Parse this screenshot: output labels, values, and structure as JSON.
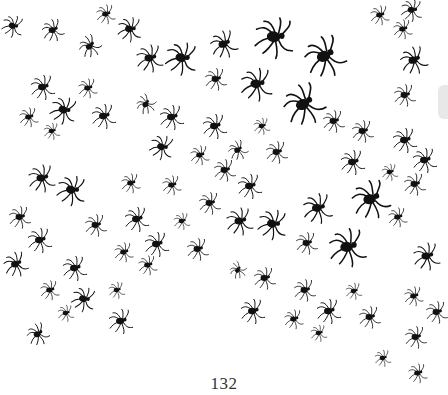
{
  "page": {
    "page_number": "132",
    "background_color": "#ffffff",
    "ink_color": "#111111",
    "illustration": "spider-swarm"
  },
  "spiders": [
    {
      "x": 13,
      "y": 26,
      "s": 0.8,
      "r": 20
    },
    {
      "x": 53,
      "y": 30,
      "s": 0.8,
      "r": -10
    },
    {
      "x": 106,
      "y": 14,
      "s": 0.7,
      "r": 0
    },
    {
      "x": 130,
      "y": 29,
      "s": 0.9,
      "r": 10
    },
    {
      "x": 90,
      "y": 46,
      "s": 0.8,
      "r": -30
    },
    {
      "x": 150,
      "y": 58,
      "s": 1.0,
      "r": 0
    },
    {
      "x": 182,
      "y": 58,
      "s": 1.2,
      "r": 15
    },
    {
      "x": 224,
      "y": 44,
      "s": 1.0,
      "r": -10
    },
    {
      "x": 275,
      "y": 37,
      "s": 1.5,
      "r": 10
    },
    {
      "x": 325,
      "y": 56,
      "s": 1.5,
      "r": -15
    },
    {
      "x": 257,
      "y": 84,
      "s": 1.2,
      "r": 5
    },
    {
      "x": 216,
      "y": 79,
      "s": 0.8,
      "r": 0
    },
    {
      "x": 304,
      "y": 104,
      "s": 1.5,
      "r": -20
    },
    {
      "x": 380,
      "y": 15,
      "s": 0.7,
      "r": 0
    },
    {
      "x": 412,
      "y": 10,
      "s": 0.8,
      "r": 10
    },
    {
      "x": 403,
      "y": 29,
      "s": 0.7,
      "r": 0
    },
    {
      "x": 414,
      "y": 60,
      "s": 1.0,
      "r": -10
    },
    {
      "x": 405,
      "y": 95,
      "s": 0.8,
      "r": 0
    },
    {
      "x": 43,
      "y": 87,
      "s": 0.9,
      "r": 0
    },
    {
      "x": 88,
      "y": 88,
      "s": 0.7,
      "r": 0
    },
    {
      "x": 64,
      "y": 110,
      "s": 1.0,
      "r": 20
    },
    {
      "x": 29,
      "y": 117,
      "s": 0.7,
      "r": 0
    },
    {
      "x": 104,
      "y": 116,
      "s": 0.9,
      "r": 0
    },
    {
      "x": 52,
      "y": 131,
      "s": 0.6,
      "r": 0
    },
    {
      "x": 146,
      "y": 104,
      "s": 0.7,
      "r": -40
    },
    {
      "x": 172,
      "y": 117,
      "s": 0.9,
      "r": 0
    },
    {
      "x": 162,
      "y": 147,
      "s": 0.9,
      "r": 20
    },
    {
      "x": 200,
      "y": 155,
      "s": 0.7,
      "r": 0
    },
    {
      "x": 215,
      "y": 126,
      "s": 0.9,
      "r": 0
    },
    {
      "x": 262,
      "y": 126,
      "s": 0.6,
      "r": 0
    },
    {
      "x": 238,
      "y": 150,
      "s": 0.7,
      "r": -20
    },
    {
      "x": 277,
      "y": 152,
      "s": 0.8,
      "r": 0
    },
    {
      "x": 334,
      "y": 121,
      "s": 0.8,
      "r": 0
    },
    {
      "x": 363,
      "y": 131,
      "s": 0.8,
      "r": 0
    },
    {
      "x": 405,
      "y": 140,
      "s": 0.9,
      "r": 0
    },
    {
      "x": 425,
      "y": 160,
      "s": 0.9,
      "r": 0
    },
    {
      "x": 353,
      "y": 162,
      "s": 0.9,
      "r": 0
    },
    {
      "x": 390,
      "y": 172,
      "s": 0.6,
      "r": 0
    },
    {
      "x": 415,
      "y": 184,
      "s": 0.8,
      "r": 0
    },
    {
      "x": 42,
      "y": 178,
      "s": 1.0,
      "r": 0
    },
    {
      "x": 72,
      "y": 190,
      "s": 1.1,
      "r": 15
    },
    {
      "x": 131,
      "y": 183,
      "s": 0.7,
      "r": 0
    },
    {
      "x": 172,
      "y": 185,
      "s": 0.7,
      "r": 0
    },
    {
      "x": 225,
      "y": 170,
      "s": 0.8,
      "r": 0
    },
    {
      "x": 250,
      "y": 186,
      "s": 0.9,
      "r": 0
    },
    {
      "x": 371,
      "y": 199,
      "s": 1.4,
      "r": -10
    },
    {
      "x": 318,
      "y": 208,
      "s": 1.1,
      "r": 0
    },
    {
      "x": 20,
      "y": 217,
      "s": 0.8,
      "r": 0
    },
    {
      "x": 96,
      "y": 225,
      "s": 0.8,
      "r": 0
    },
    {
      "x": 137,
      "y": 219,
      "s": 0.9,
      "r": 0
    },
    {
      "x": 182,
      "y": 221,
      "s": 0.6,
      "r": 0
    },
    {
      "x": 210,
      "y": 203,
      "s": 0.8,
      "r": 0
    },
    {
      "x": 240,
      "y": 221,
      "s": 1.0,
      "r": 0
    },
    {
      "x": 273,
      "y": 224,
      "s": 1.1,
      "r": 15
    },
    {
      "x": 398,
      "y": 217,
      "s": 0.7,
      "r": 0
    },
    {
      "x": 40,
      "y": 240,
      "s": 0.9,
      "r": 0
    },
    {
      "x": 16,
      "y": 264,
      "s": 0.9,
      "r": -10
    },
    {
      "x": 75,
      "y": 268,
      "s": 0.9,
      "r": 0
    },
    {
      "x": 124,
      "y": 252,
      "s": 0.7,
      "r": 0
    },
    {
      "x": 148,
      "y": 265,
      "s": 0.7,
      "r": 0
    },
    {
      "x": 157,
      "y": 244,
      "s": 0.9,
      "r": 0
    },
    {
      "x": 198,
      "y": 249,
      "s": 0.8,
      "r": 0
    },
    {
      "x": 238,
      "y": 270,
      "s": 0.6,
      "r": -40
    },
    {
      "x": 265,
      "y": 278,
      "s": 0.8,
      "r": 0
    },
    {
      "x": 307,
      "y": 243,
      "s": 0.8,
      "r": 0
    },
    {
      "x": 348,
      "y": 247,
      "s": 1.4,
      "r": 0
    },
    {
      "x": 427,
      "y": 256,
      "s": 1.0,
      "r": 0
    },
    {
      "x": 50,
      "y": 290,
      "s": 0.7,
      "r": 0
    },
    {
      "x": 84,
      "y": 299,
      "s": 0.9,
      "r": 20
    },
    {
      "x": 117,
      "y": 290,
      "s": 0.6,
      "r": 0
    },
    {
      "x": 66,
      "y": 313,
      "s": 0.6,
      "r": 0
    },
    {
      "x": 121,
      "y": 321,
      "s": 0.9,
      "r": 0
    },
    {
      "x": 253,
      "y": 311,
      "s": 0.9,
      "r": 0
    },
    {
      "x": 294,
      "y": 319,
      "s": 0.7,
      "r": 0
    },
    {
      "x": 329,
      "y": 311,
      "s": 0.9,
      "r": 0
    },
    {
      "x": 319,
      "y": 333,
      "s": 0.6,
      "r": 0
    },
    {
      "x": 305,
      "y": 290,
      "s": 0.8,
      "r": 0
    },
    {
      "x": 354,
      "y": 291,
      "s": 0.6,
      "r": 0
    },
    {
      "x": 370,
      "y": 317,
      "s": 0.8,
      "r": 0
    },
    {
      "x": 414,
      "y": 296,
      "s": 0.7,
      "r": 0
    },
    {
      "x": 437,
      "y": 312,
      "s": 0.8,
      "r": 0
    },
    {
      "x": 416,
      "y": 337,
      "s": 0.8,
      "r": 0
    },
    {
      "x": 383,
      "y": 358,
      "s": 0.6,
      "r": 0
    },
    {
      "x": 418,
      "y": 373,
      "s": 0.7,
      "r": 0
    },
    {
      "x": 38,
      "y": 334,
      "s": 0.8,
      "r": -20
    }
  ]
}
